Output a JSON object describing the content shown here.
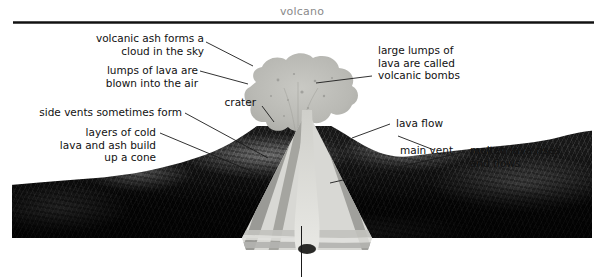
{
  "header": {
    "title": "volcano"
  },
  "figure": {
    "alt": "labelled cut-away diagram of a volcano",
    "labels": [
      {
        "id": "ash-cloud",
        "text": "volcanic ash forms a\ncloud in the sky"
      },
      {
        "id": "lumps-of-lava",
        "text": "lumps of lava are\nblown into the air"
      },
      {
        "id": "crater",
        "text": "crater"
      },
      {
        "id": "side-vents",
        "text": "side vents sometimes form"
      },
      {
        "id": "layers",
        "text": "layers of cold\nlava and ash build\nup a cone"
      },
      {
        "id": "volcanic-bombs",
        "text": "large lumps of\nlava are called\nvolcanic bombs"
      },
      {
        "id": "lava-flow",
        "text": "lava flow"
      },
      {
        "id": "main-vent",
        "text": "main vent"
      },
      {
        "id": "molten-lava",
        "text": "molten lava rises\nand flows"
      }
    ]
  },
  "colors": {
    "title_gray": "#8a8a8a",
    "rule_dark": "#111111",
    "label_text": "#111111",
    "leader_line": "#1b1b1b",
    "ash_cloud": "#b9b9b4",
    "cone_light_band": "#d8d8d4",
    "cone_dark_band": "#9a9a96",
    "terrain_dark": "#0a0a0a",
    "page_background": "#ffffff"
  }
}
